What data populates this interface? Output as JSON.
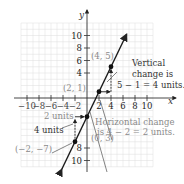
{
  "chart_data": {
    "type": "line",
    "title": "",
    "xlabel": "x",
    "ylabel": "y",
    "xlim": [
      -11,
      11
    ],
    "ylim": [
      -11,
      12
    ],
    "grid": true,
    "x_ticks": [
      -10,
      -8,
      -6,
      -4,
      -2,
      2,
      4,
      6,
      8,
      10
    ],
    "x_tick_labels": [
      "−10",
      "−8",
      "−6",
      "−4",
      "−2",
      "2",
      "4",
      "6",
      "8",
      "10"
    ],
    "y_ticks": [
      10,
      8,
      6,
      4,
      -8,
      -10
    ],
    "y_tick_labels": [
      "10",
      "8",
      "6",
      "4",
      "8",
      "10"
    ],
    "line": {
      "slope": 2,
      "intercept": -3,
      "x_range": [
        -4.2,
        6.6
      ],
      "color": "#1a1a1a"
    },
    "points": [
      {
        "x": 4,
        "y": 5,
        "label": "(4, 5)"
      },
      {
        "x": 2,
        "y": 1,
        "label": "(2, 1)"
      },
      {
        "x": 0,
        "y": -3,
        "label": "(0, 3)"
      },
      {
        "x": -2,
        "y": -7,
        "label": "(−2, −7)"
      }
    ],
    "annotations": [
      {
        "id": "vertical",
        "lines": [
          "Vertical",
          "change is",
          "5 − 1 = 4 units."
        ],
        "color": "#333333"
      },
      {
        "id": "horizontal",
        "lines": [
          "Horizontal change",
          "is 4 − 2 = 2 units."
        ],
        "color": "#8a8a8a"
      },
      {
        "id": "two-units",
        "lines": [
          "2 units"
        ],
        "color": "#8a8a8a"
      },
      {
        "id": "four-units",
        "lines": [
          "4 units"
        ],
        "color": "#333333"
      }
    ],
    "colors": {
      "axis": "#333333",
      "grid": "#dcdcdc",
      "muted": "#8a8a8a",
      "dark": "#222222"
    }
  }
}
